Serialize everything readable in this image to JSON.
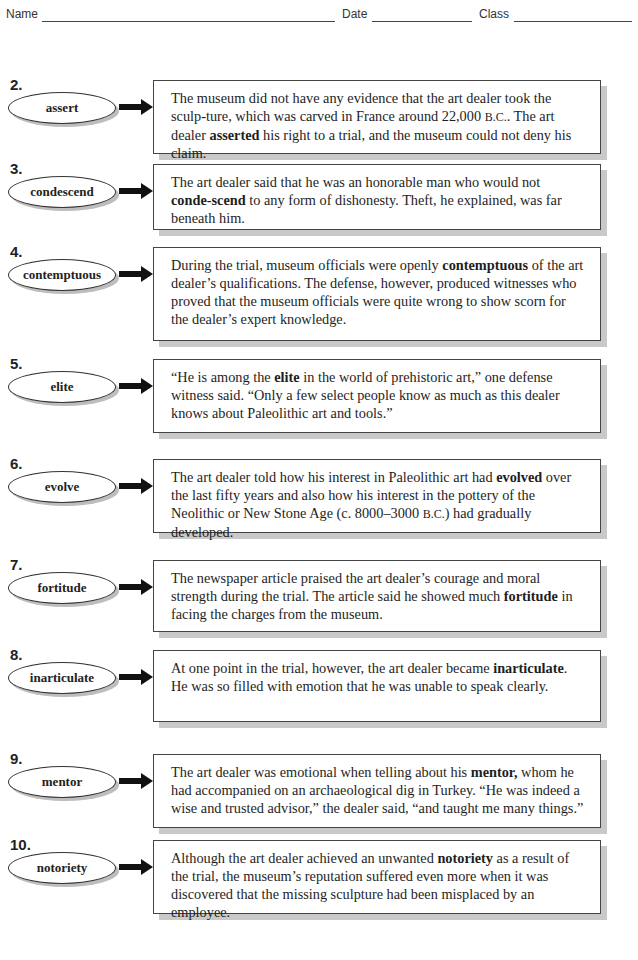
{
  "header": {
    "name_label": "Name",
    "date_label": "Date",
    "class_label": "Class"
  },
  "items": [
    {
      "number": "2.",
      "word": "assert",
      "sentence_parts": [
        "The museum did not have any evidence that the art dealer took the sculp-ture, which was carved in France around 22,000 ",
        "B.C.",
        ". The art dealer ",
        "asserted",
        " his right to a trial, and the museum could not deny his claim."
      ]
    },
    {
      "number": "3.",
      "word": "condescend",
      "sentence_parts": [
        "The art dealer said that he was an honorable man who would not ",
        "conde-scend",
        " to any form of dishonesty. Theft, he explained, was far beneath him."
      ]
    },
    {
      "number": "4.",
      "word": "contemptuous",
      "sentence_parts": [
        "During the trial, museum officials were openly ",
        "contemptuous",
        " of the art dealer’s qualifications. The defense, however, produced witnesses who proved that the museum officials were quite wrong to show scorn for the dealer’s expert knowledge."
      ]
    },
    {
      "number": "5.",
      "word": "elite",
      "sentence_parts": [
        "“He is among the ",
        "elite",
        " in the world of prehistoric art,” one defense witness said. “Only a few select people know as much as this dealer knows about Paleolithic art and tools.”"
      ]
    },
    {
      "number": "6.",
      "word": "evolve",
      "sentence_parts": [
        "The art dealer told how his interest in Paleolithic art had ",
        "evolved",
        " over the last fifty years and also how his interest in the pottery of the Neolithic or New Stone Age (c. 8000–3000 ",
        "B.C.",
        ") had gradually developed."
      ]
    },
    {
      "number": "7.",
      "word": "fortitude",
      "sentence_parts": [
        "The newspaper article praised the art dealer’s courage and moral strength during the trial. The article said he showed much ",
        "fortitude",
        " in facing the charges from the museum."
      ]
    },
    {
      "number": "8.",
      "word": "inarticulate",
      "sentence_parts": [
        "At one point in the trial, however, the art dealer became ",
        "inarticulate",
        ". He was so filled with emotion that he was unable to speak clearly."
      ]
    },
    {
      "number": "9.",
      "word": "mentor",
      "sentence_parts": [
        "The art dealer was emotional when telling about his ",
        "mentor,",
        " whom he had accompanied on an archaeological dig in Turkey. “He was indeed a wise and trusted advisor,” the dealer said, “and taught me many things.”"
      ]
    },
    {
      "number": "10.",
      "word": "notoriety",
      "sentence_parts": [
        "Although the art dealer achieved an unwanted ",
        "notoriety",
        " as a result of the trial, the museum’s reputation suffered even more when it was discovered that the missing sculpture had been misplaced by an employee."
      ]
    }
  ]
}
